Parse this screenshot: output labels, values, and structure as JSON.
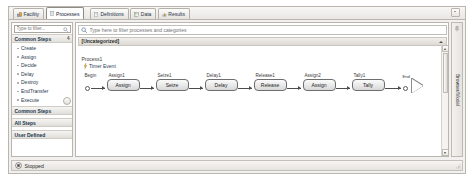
{
  "window": {
    "tabs": [
      {
        "label": "Facility",
        "icon": "facility-icon",
        "active": false
      },
      {
        "label": "Processes",
        "icon": "processes-icon",
        "active": true
      },
      {
        "label": "Definitions",
        "icon": "definitions-icon",
        "active": false
      },
      {
        "label": "Data",
        "icon": "data-icon",
        "active": false
      },
      {
        "label": "Results",
        "icon": "results-icon",
        "active": false
      }
    ],
    "overflow_icon": "chevron-down-icon"
  },
  "sidebar": {
    "filter": {
      "value": "",
      "placeholder": "Type to filter...",
      "icon": "search-icon"
    },
    "group_header": {
      "label": "Common Steps",
      "pin": "4"
    },
    "steps": [
      {
        "label": "Create"
      },
      {
        "label": "Assign"
      },
      {
        "label": "Decide"
      },
      {
        "label": "Delay"
      },
      {
        "label": "Destroy"
      },
      {
        "label": "EndTransfer"
      },
      {
        "label": "Execute"
      }
    ],
    "groups": [
      {
        "label": "Common Steps"
      },
      {
        "label": "All Steps"
      },
      {
        "label": "User Defined"
      }
    ]
  },
  "main": {
    "search": {
      "value": "",
      "placeholder": "Type here to filter processes and categories",
      "icon": "search-icon"
    },
    "category": {
      "label": "[Uncategorized]",
      "caret": "chevron-down-icon"
    },
    "process": {
      "name": "Process1",
      "trigger": {
        "label": "Timer Event",
        "icon": "lightning-bolt-icon"
      }
    },
    "flow": {
      "begin": {
        "label": "Begin"
      },
      "nodes": [
        {
          "name": "Assign1",
          "type": "Assign"
        },
        {
          "name": "Seize1",
          "type": "Seize"
        },
        {
          "name": "Delay1",
          "type": "Delay"
        },
        {
          "name": "Release1",
          "type": "Release"
        },
        {
          "name": "Assign2",
          "type": "Assign"
        },
        {
          "name": "Tally1",
          "type": "Tally"
        }
      ],
      "end": {
        "label": "End"
      }
    }
  },
  "rightdock": {
    "label": "Browser/Model",
    "pin_icon": "pin-icon"
  },
  "statusbar": {
    "status": "Stopped",
    "icon": "stopped-icon"
  },
  "colors": {
    "accent": "#21364f",
    "chrome": "#f2f1ef",
    "border": "#b9b6b0",
    "node_fill": "#d8d8d8"
  }
}
